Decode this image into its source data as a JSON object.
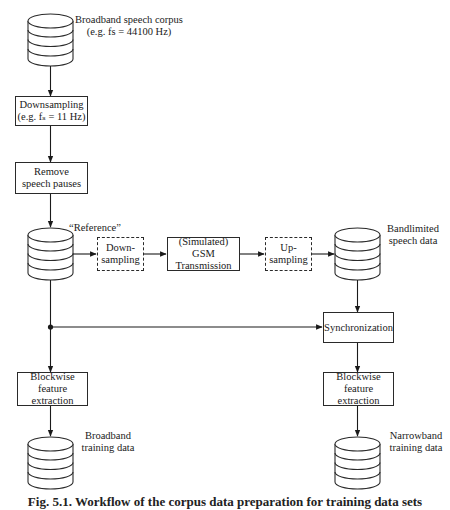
{
  "diagram": {
    "databases": [
      {
        "id": "broadband-corpus",
        "label_line1": "Broadband speech corpus",
        "label_line2": "(e.g. fs = 44100 Hz)"
      },
      {
        "id": "reference",
        "label_line1": "“Reference”"
      },
      {
        "id": "bandlimited",
        "label_line1": "Bandlimited",
        "label_line2": "speech data"
      },
      {
        "id": "broadband-training",
        "label_line1": "Broadband",
        "label_line2": "training data"
      },
      {
        "id": "narrowband-training",
        "label_line1": "Narrowband",
        "label_line2": "training data"
      }
    ],
    "boxes": {
      "downsampling": {
        "line1": "Downsampling",
        "line2": "(e.g. fₛ = 11 Hz)"
      },
      "remove_pauses": {
        "line1": "Remove",
        "line2": "speech pauses"
      },
      "down_sampling_sim": {
        "line1": "Down-",
        "line2": "sampling",
        "style": "dashed"
      },
      "gsm": {
        "line1": "(Simulated) GSM",
        "line2": "Transmission"
      },
      "up_sampling_sim": {
        "line1": "Up-",
        "line2": "sampling",
        "style": "dashed"
      },
      "synchronization": {
        "line1": "Synchronization"
      },
      "feature_left": {
        "line1": "Blockwise feature",
        "line2": "extraction"
      },
      "feature_right": {
        "line1": "Blockwise feature",
        "line2": "extraction"
      }
    },
    "caption": "Fig. 5.1. Workflow of the corpus data preparation for training data sets"
  }
}
